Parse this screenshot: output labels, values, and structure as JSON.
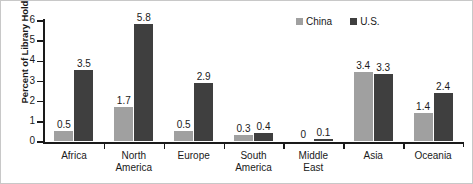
{
  "chart_data": {
    "type": "bar",
    "title": "",
    "xlabel": "",
    "ylabel": "Percent of Library Holdings",
    "ylim": [
      0,
      6
    ],
    "yticks": [
      "0",
      "1",
      "2",
      "3",
      "4",
      "5",
      "6"
    ],
    "grid": false,
    "legend_position": "top-right",
    "categories": [
      "Africa",
      "North\nAmerica",
      "Europe",
      "South\nAmerica",
      "Middle\nEast",
      "Asia",
      "Oceania"
    ],
    "series": [
      {
        "name": "China",
        "color": "#a0a0a0",
        "values": [
          0.5,
          1.7,
          0.5,
          0.3,
          0,
          3.4,
          1.4
        ],
        "labels": [
          "0.5",
          "1.7",
          "0.5",
          "0.3",
          "0",
          "3.4",
          "1.4"
        ]
      },
      {
        "name": "U.S.",
        "color": "#3f3f3f",
        "values": [
          3.5,
          5.8,
          2.9,
          0.4,
          0.1,
          3.3,
          2.4
        ],
        "labels": [
          "3.5",
          "5.8",
          "2.9",
          "0.4",
          "0.1",
          "3.3",
          "2.4"
        ]
      }
    ]
  },
  "legend": {
    "items": [
      {
        "label": "China"
      },
      {
        "label": "U.S."
      }
    ]
  },
  "axes": {
    "y_title": "Percent of Library Holdings"
  }
}
